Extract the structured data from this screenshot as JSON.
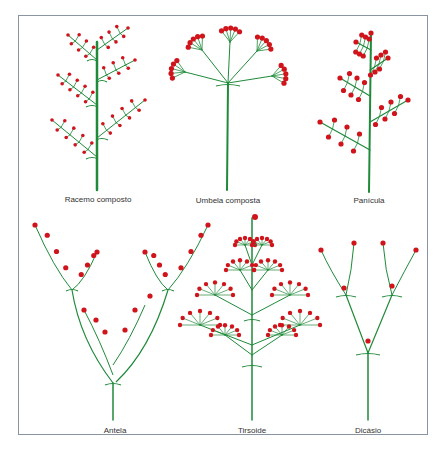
{
  "colors": {
    "stem": "#1f8a3a",
    "flower": "#d0141c",
    "frame": "#8a93a0"
  },
  "diagrams": [
    {
      "id": "racemo-composto",
      "label": "Racemo composto"
    },
    {
      "id": "umbela-composta",
      "label": "Umbela composta"
    },
    {
      "id": "panicula",
      "label": "Panícula"
    },
    {
      "id": "antela",
      "label": "Antela"
    },
    {
      "id": "tirsoide",
      "label": "Tirsoide"
    },
    {
      "id": "dicasio",
      "label": "Dicásio"
    }
  ]
}
